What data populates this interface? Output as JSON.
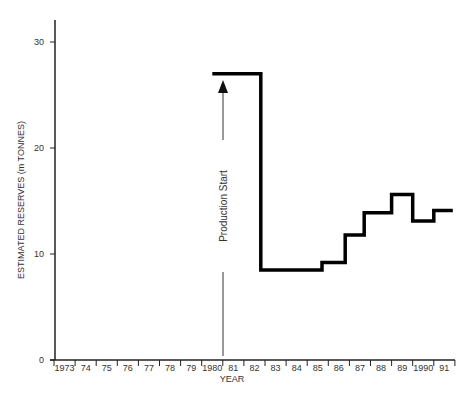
{
  "chart_data": {
    "type": "line",
    "subtype": "step",
    "title": "",
    "xlabel": "YEAR",
    "ylabel": "ESTIMATED RESERVES (m TONNES)",
    "ylim": [
      0,
      32
    ],
    "yticks": [
      0,
      10,
      20,
      30
    ],
    "x_tick_labels": [
      "1973",
      "74",
      "75",
      "76",
      "77",
      "78",
      "79",
      "1980",
      "81",
      "82",
      "83",
      "84",
      "85",
      "86",
      "87",
      "88",
      "89",
      "1990",
      "91"
    ],
    "grid": false,
    "legend": null,
    "series": [
      {
        "name": "Estimated reserves",
        "steps": [
          {
            "x_start": 1980.0,
            "x_end": 1982.3,
            "value": 27
          },
          {
            "x_start": 1982.3,
            "x_end": 1985.2,
            "value": 8.5
          },
          {
            "x_start": 1985.2,
            "x_end": 1986.3,
            "value": 9.2
          },
          {
            "x_start": 1986.3,
            "x_end": 1987.2,
            "value": 11.8
          },
          {
            "x_start": 1987.2,
            "x_end": 1988.5,
            "value": 13.9
          },
          {
            "x_start": 1988.5,
            "x_end": 1989.5,
            "value": 15.6
          },
          {
            "x_start": 1989.5,
            "x_end": 1990.5,
            "value": 13.1
          },
          {
            "x_start": 1990.5,
            "x_end": 1991.4,
            "value": 14.1
          }
        ]
      }
    ],
    "annotations": [
      {
        "text": "Production Start",
        "x": 1981,
        "type": "vertical-arrow",
        "points_to_value": 26
      }
    ]
  }
}
